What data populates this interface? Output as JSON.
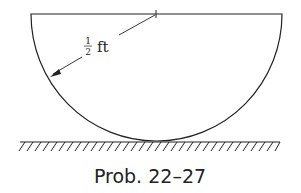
{
  "figure": {
    "shape": "semicircle (half-disk) resting on flat ground",
    "dimension": {
      "numerator": "1",
      "denominator": "2",
      "unit": "ft",
      "label": "1/2 ft",
      "refers_to": "radius"
    },
    "caption": "Prob. 22–27",
    "colors": {
      "line": "#222222",
      "background": "#ffffff"
    }
  }
}
